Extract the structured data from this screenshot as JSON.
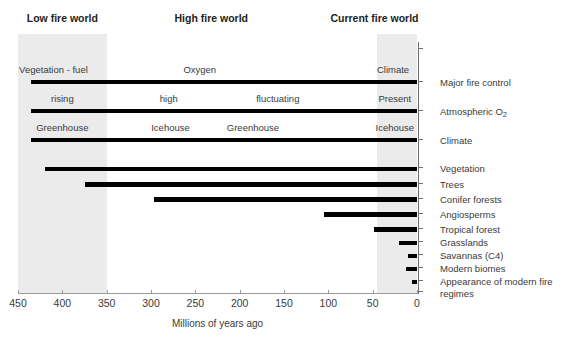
{
  "chart_data": {
    "type": "timeline",
    "title": "",
    "xlabel": "Millions of years ago",
    "xlim": [
      450,
      0
    ],
    "x_ticks": [
      450,
      400,
      350,
      300,
      250,
      200,
      150,
      100,
      50,
      0
    ],
    "x_tick_labels": [
      "450",
      "400",
      "350",
      "300",
      "250",
      "200",
      "150",
      "100",
      "50",
      "0"
    ],
    "axis_direction": "reversed",
    "grid": false,
    "eras": [
      {
        "label": "Low fire world",
        "start": 455,
        "end": 350,
        "shaded": true,
        "center": 400
      },
      {
        "label": "High fire world",
        "start": 350,
        "end": 45,
        "shaded": false,
        "center": 232
      },
      {
        "label": "Current fire world",
        "start": 45,
        "end": 0,
        "shaded": true,
        "center": 48
      }
    ],
    "attribute_rows": [
      {
        "name": "Major fire control",
        "bar_start": 435,
        "bar_end": 0,
        "captions": [
          {
            "text": "Vegetation - fuel",
            "at": 410
          },
          {
            "text": "Oxygen",
            "at": 245
          },
          {
            "text": "Climate",
            "at": 27
          }
        ]
      },
      {
        "name": "Atmospheric O2",
        "name_html": "Atmospheric O<sub>2</sub>",
        "bar_start": 435,
        "bar_end": 0,
        "captions": [
          {
            "text": "rising",
            "at": 400
          },
          {
            "text": "high",
            "at": 280
          },
          {
            "text": "fluctuating",
            "at": 157
          },
          {
            "text": "Present",
            "at": 25
          }
        ]
      },
      {
        "name": "Climate",
        "bar_start": 435,
        "bar_end": 0,
        "captions": [
          {
            "text": "Greenhouse",
            "at": 400
          },
          {
            "text": "Icehouse",
            "at": 278
          },
          {
            "text": "Greenhouse",
            "at": 185
          },
          {
            "text": "Icehouse",
            "at": 25
          }
        ]
      }
    ],
    "event_rows": [
      {
        "name": "Vegetation",
        "start": 420,
        "end": 0
      },
      {
        "name": "Trees",
        "start": 375,
        "end": 0
      },
      {
        "name": "Conifer forests",
        "start": 297,
        "end": 0
      },
      {
        "name": "Angiosperms",
        "start": 105,
        "end": 0
      },
      {
        "name": "Tropical forest",
        "start": 48,
        "end": 0
      },
      {
        "name": "Grasslands",
        "start": 20,
        "end": 0
      },
      {
        "name": "Savannas (C4)",
        "start": 10,
        "end": 0
      },
      {
        "name": "Modern biomes",
        "start": 12,
        "end": 0
      },
      {
        "name": "Appearance of modern fire regimes",
        "start": 6,
        "end": 0
      }
    ]
  },
  "colors": {
    "band": "#ebebeb",
    "bar": "#000000",
    "text": "#3a3a3a",
    "heading": "#231f20",
    "axis": "#6e6e6e",
    "background": "#ffffff"
  },
  "axis": {
    "title": "Millions of years ago",
    "ticks": [
      "450",
      "400",
      "350",
      "300",
      "250",
      "200",
      "150",
      "100",
      "50",
      "0"
    ]
  },
  "eras": {
    "low": "Low fire world",
    "high": "High fire world",
    "current": "Current fire world"
  },
  "rows": {
    "major_fire_control": "Major fire control",
    "atmospheric_o2": "Atmospheric O",
    "atmospheric_o2_sub": "2",
    "climate": "Climate",
    "vegetation": "Vegetation",
    "trees": "Trees",
    "conifer_forests": "Conifer forests",
    "angiosperms": "Angiosperms",
    "tropical_forest": "Tropical forest",
    "grasslands": "Grasslands",
    "savannas": "Savannas (C4)",
    "modern_biomes": "Modern biomes",
    "modern_fire_regimes": "Appearance of modern fire regimes"
  },
  "captions": {
    "r1": [
      "Vegetation - fuel",
      "Oxygen",
      "Climate"
    ],
    "r2": [
      "rising",
      "high",
      "fluctuating",
      "Present"
    ],
    "r3": [
      "Greenhouse",
      "Icehouse",
      "Greenhouse",
      "Icehouse"
    ]
  }
}
